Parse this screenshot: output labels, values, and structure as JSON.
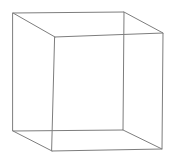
{
  "figure": {
    "kind": "wireframe-cube-line-drawing",
    "background_color": "#ffffff",
    "canvas": {
      "width": 173,
      "height": 160
    },
    "stroke": {
      "color": "#7d7d7d",
      "width": 1,
      "style": "solid"
    },
    "vertices": {
      "back_top_left": {
        "name": "back-top-left",
        "x": 13,
        "y": 13
      },
      "back_top_right": {
        "name": "back-top-right",
        "x": 124,
        "y": 12
      },
      "back_bottom_right": {
        "name": "back-bottom-right",
        "x": 123,
        "y": 130
      },
      "back_bottom_left": {
        "name": "back-bottom-left",
        "x": 13,
        "y": 131
      },
      "front_top_left": {
        "name": "front-top-left",
        "x": 55,
        "y": 37
      },
      "front_top_right": {
        "name": "front-top-right",
        "x": 163,
        "y": 33
      },
      "front_bottom_right": {
        "name": "front-bottom-right",
        "x": 162,
        "y": 149
      },
      "front_bottom_left": {
        "name": "front-bottom-left",
        "x": 52,
        "y": 151
      }
    },
    "edges": {
      "back_face_path": "M 13 13 L 124 12 L 123 130 L 13 131 Z",
      "front_face_path": "M 55 37 L 163 33 L 162 149 L 52 151 Z",
      "connector_top_left_path": "M 13 13 L 55 37",
      "connector_top_right_path": "M 124 12 L 163 33",
      "connector_bottom_right_path": "M 123 130 L 162 149",
      "connector_bottom_left_path": "M 13 131 L 52 151"
    },
    "edge_count": 12,
    "vertex_count": 8,
    "face_count": 6
  }
}
